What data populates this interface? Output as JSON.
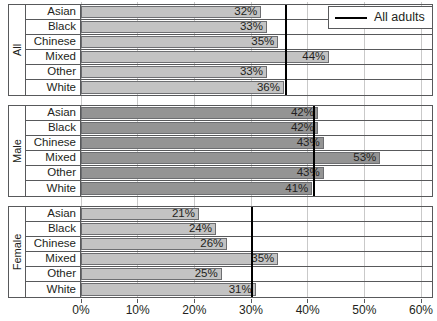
{
  "chart_data": {
    "type": "bar",
    "orientation": "horizontal",
    "title": "",
    "xlabel": "",
    "ylabel": "",
    "xlim": [
      0,
      60
    ],
    "xticks": [
      0,
      10,
      20,
      30,
      40,
      50,
      60
    ],
    "xticklabels": [
      "0%",
      "10%",
      "20%",
      "30%",
      "40%",
      "50%",
      "60%"
    ],
    "grid": true,
    "legend": {
      "position": "top-right",
      "entries": [
        {
          "label": "All adults",
          "marker": "line",
          "color": "#000000"
        }
      ]
    },
    "categories": [
      "Asian",
      "Black",
      "Chinese",
      "Mixed",
      "Other",
      "White"
    ],
    "panels": [
      {
        "name": "All",
        "fill": "#c3c3c3",
        "reference_value": 36,
        "bars": [
          {
            "category": "Asian",
            "value": 32,
            "label": "32%",
            "label_inside": true
          },
          {
            "category": "Black",
            "value": 33,
            "label": "33%",
            "label_inside": true
          },
          {
            "category": "Chinese",
            "value": 35,
            "label": "35%",
            "label_inside": true
          },
          {
            "category": "Mixed",
            "value": 44,
            "label": "44%",
            "label_inside": true
          },
          {
            "category": "Other",
            "value": 33,
            "label": "33%",
            "label_inside": true
          },
          {
            "category": "White",
            "value": 36,
            "label": "36%",
            "label_inside": true
          }
        ]
      },
      {
        "name": "Male",
        "fill": "#949494",
        "reference_value": 41,
        "bars": [
          {
            "category": "Asian",
            "value": 42,
            "label": "42%",
            "label_inside": true
          },
          {
            "category": "Black",
            "value": 42,
            "label": "42%",
            "label_inside": true
          },
          {
            "category": "Chinese",
            "value": 43,
            "label": "43%",
            "label_inside": true
          },
          {
            "category": "Mixed",
            "value": 53,
            "label": "53%",
            "label_inside": true
          },
          {
            "category": "Other",
            "value": 43,
            "label": "43%",
            "label_inside": true
          },
          {
            "category": "White",
            "value": 41,
            "label": "41%",
            "label_inside": true
          }
        ]
      },
      {
        "name": "Female",
        "fill": "#c3c3c3",
        "reference_value": 30,
        "bars": [
          {
            "category": "Asian",
            "value": 21,
            "label": "21%",
            "label_inside": true
          },
          {
            "category": "Black",
            "value": 24,
            "label": "24%",
            "label_inside": true
          },
          {
            "category": "Chinese",
            "value": 26,
            "label": "26%",
            "label_inside": true
          },
          {
            "category": "Mixed",
            "value": 35,
            "label": "35%",
            "label_inside": true
          },
          {
            "category": "Other",
            "value": 25,
            "label": "25%",
            "label_inside": true
          },
          {
            "category": "White",
            "value": 31,
            "label": "31%",
            "label_inside": true
          }
        ]
      }
    ]
  }
}
